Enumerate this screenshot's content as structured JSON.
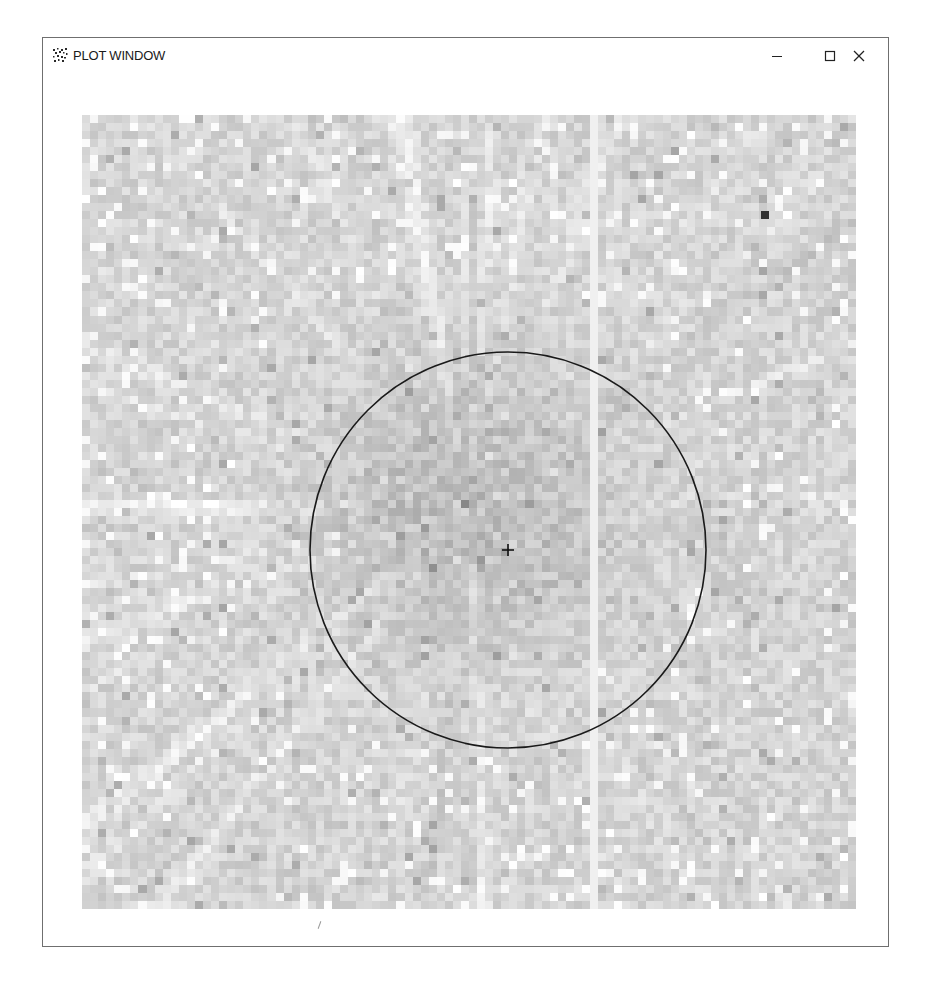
{
  "window": {
    "title": "PLOT WINDOW",
    "icon": "scatter-dots-icon",
    "controls": {
      "minimize": "minimize-icon",
      "maximize": "maximize-icon",
      "close": "close-icon"
    }
  },
  "plot": {
    "type": "grayscale-pixel-image",
    "grid": {
      "cols": 96,
      "rows": 99
    },
    "colormap": "gray",
    "overlay": {
      "circle": {
        "cx": 426,
        "cy": 435,
        "r": 198,
        "stroke": "#1a1a1a"
      },
      "center_marker": {
        "x": 426,
        "y": 435,
        "symbol": "+"
      }
    },
    "highlight_pixel": {
      "x": 683,
      "y": 100,
      "color": "#333333"
    },
    "background_shade": "#d8d8d8"
  },
  "colors": {
    "window_border": "#6f6f6f",
    "title_text": "#1a1a1a",
    "circle": "#1a1a1a"
  }
}
